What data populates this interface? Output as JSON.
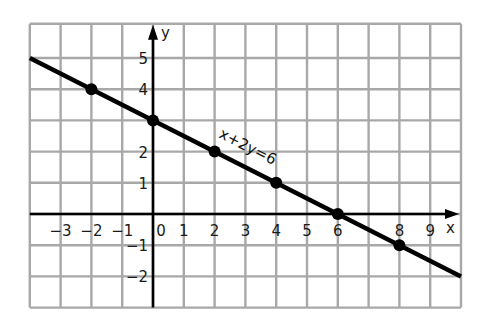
{
  "chart_data": {
    "type": "line",
    "title": "",
    "equation_label": "x+2y=6",
    "xlabel": "x",
    "ylabel": "y",
    "xlim": [
      -4,
      10
    ],
    "ylim": [
      -3,
      6
    ],
    "grid": true,
    "x_ticks": [
      -3,
      -2,
      -1,
      0,
      1,
      2,
      3,
      4,
      5,
      6,
      8,
      9
    ],
    "y_ticks": [
      -2,
      -1,
      1,
      2,
      4,
      5
    ],
    "series": [
      {
        "name": "x+2y=6",
        "line": {
          "from": [
            -4,
            5
          ],
          "to": [
            10,
            -2
          ]
        },
        "points": [
          {
            "x": -2,
            "y": 4
          },
          {
            "x": 0,
            "y": 3
          },
          {
            "x": 2,
            "y": 2
          },
          {
            "x": 4,
            "y": 1
          },
          {
            "x": 6,
            "y": 0
          },
          {
            "x": 8,
            "y": -1
          }
        ]
      }
    ]
  },
  "colors": {
    "grid": "#a8a8a8",
    "axis": "#000000",
    "line": "#000000",
    "background": "#ffffff"
  }
}
